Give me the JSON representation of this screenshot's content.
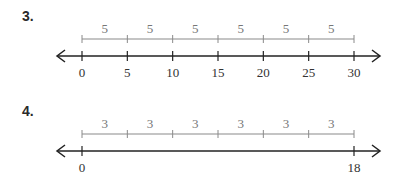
{
  "problems": [
    {
      "number": "3.",
      "segment_labels": [
        "5",
        "5",
        "5",
        "5",
        "5",
        "5"
      ],
      "tick_labels": [
        "0",
        "5",
        "10",
        "15",
        "20",
        "25",
        "30"
      ],
      "tick_values": [
        0,
        5,
        10,
        15,
        20,
        25,
        30
      ]
    },
    {
      "number": "4.",
      "segment_labels": [
        "3",
        "3",
        "3",
        "3",
        "3",
        "3"
      ],
      "tick_labels": [
        "0",
        "",
        "",
        "",
        "",
        "",
        "18"
      ],
      "tick_values": [
        0,
        3,
        6,
        9,
        12,
        15,
        18
      ]
    }
  ],
  "colors": {
    "bar": "#8a8a8a",
    "line": "#222222"
  }
}
